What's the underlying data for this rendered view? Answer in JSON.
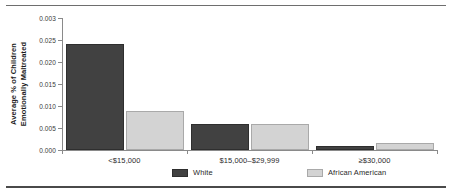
{
  "chart_data": {
    "type": "bar",
    "title": "",
    "xlabel": "",
    "ylabel_lines": [
      "Average % of Children",
      "Emotionally Maltreated"
    ],
    "categories": [
      "<$15,000",
      "$15,000–$29,999",
      "≥30,000"
    ],
    "category_labels": [
      "<$15,000",
      "$15,000–$29,999",
      "≥$30,000"
    ],
    "series": [
      {
        "name": "White",
        "color": "#414141",
        "values": [
          0.024,
          0.006,
          0.0008
        ]
      },
      {
        "name": "African American",
        "color": "#d3d3d3",
        "values": [
          0.0088,
          0.006,
          0.0017
        ]
      }
    ],
    "ylim": [
      0,
      0.03
    ],
    "ytick_values": [
      0.0,
      0.005,
      0.01,
      0.015,
      0.02,
      0.025,
      0.03
    ],
    "ytick_labels": [
      "0.000",
      "0.005",
      "0.010",
      "0.015",
      "0.020",
      "0.025",
      "0.003"
    ],
    "grid": false,
    "legend_position": "bottom-center"
  },
  "legend": {
    "items": [
      {
        "label": "White"
      },
      {
        "label": "African American"
      }
    ]
  }
}
